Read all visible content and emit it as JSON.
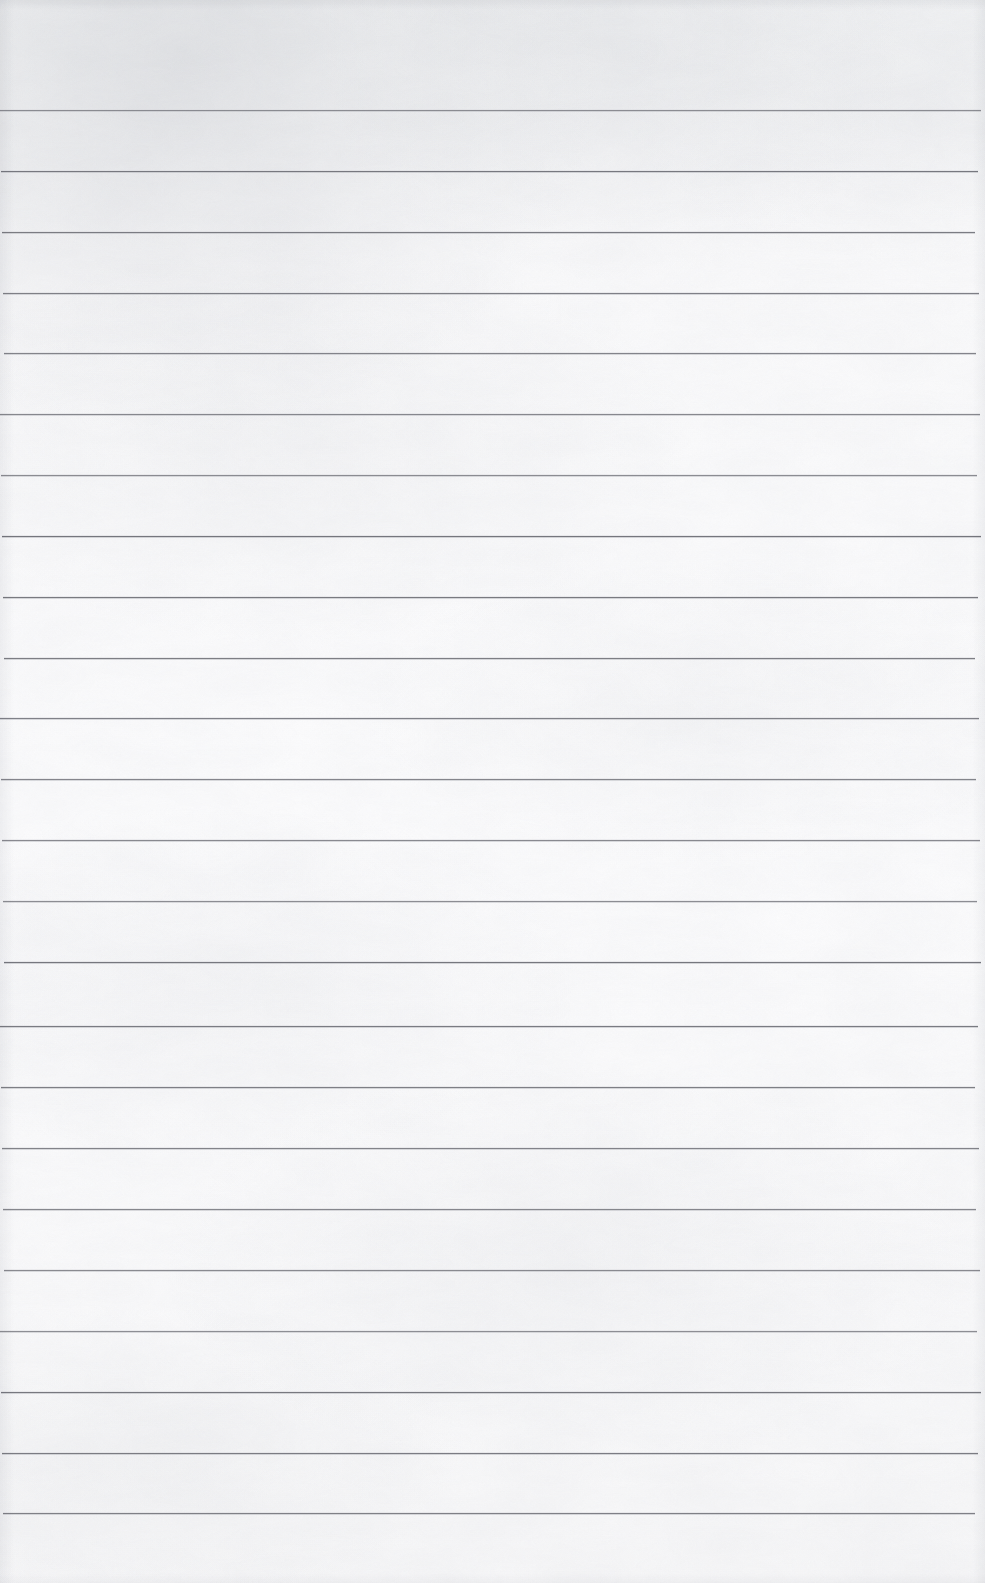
{
  "document": {
    "kind": "scanned-blank-lined-notebook-page",
    "title": "Blank Ruled Notebook Page",
    "written_text": "",
    "page_number_text": "",
    "header_text": "",
    "footer_text": "",
    "marginalia_text": ""
  },
  "page": {
    "width": 985,
    "height": 1583,
    "paper_color": "#fbfbfc",
    "paper_shadow_color": "#c4c6cb",
    "background_color": "#ffffff"
  },
  "ruling": {
    "line_color": "#74757c",
    "line_halo_color": "#b9bac0",
    "line_thickness": 1,
    "line_count": 24,
    "first_line_y": 110,
    "line_spacing": 61,
    "line_start_x": 2,
    "line_end_x": 978,
    "has_vertical_margin_rule": false,
    "has_header_rule": false,
    "lines_y": [
      110,
      171,
      232,
      293,
      353,
      414,
      475,
      536,
      597,
      658,
      718,
      779,
      840,
      901,
      962,
      1026,
      1087,
      1148,
      1209,
      1270,
      1331,
      1392,
      1453,
      1513
    ]
  },
  "texture": {
    "grain_opacity": 0.5,
    "mottle_opacity": 0.55,
    "vignette_color": "#bec0c6",
    "top_left_shading_color": "#c4c6cb"
  }
}
